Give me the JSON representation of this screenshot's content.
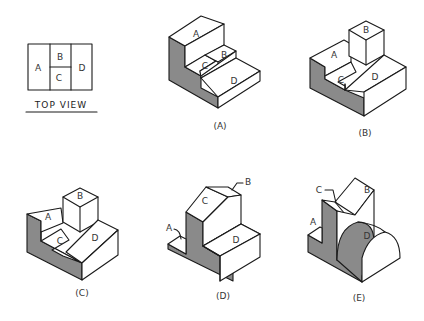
{
  "top_view": {
    "title": "TOP VIEW",
    "regions": {
      "a": "A",
      "b": "B",
      "c": "C",
      "d": "D"
    }
  },
  "figures": [
    {
      "caption": "(A)",
      "labels": {
        "a": "A",
        "b": "B",
        "c": "C",
        "d": "D"
      }
    },
    {
      "caption": "(B)",
      "labels": {
        "a": "A",
        "b": "B",
        "c": "C",
        "d": "D"
      }
    },
    {
      "caption": "(C)",
      "labels": {
        "a": "A",
        "b": "B",
        "c": "C",
        "d": "D"
      }
    },
    {
      "caption": "(D)",
      "labels": {
        "a": "A",
        "b": "B",
        "c": "C",
        "d": "D"
      }
    },
    {
      "caption": "(E)",
      "labels": {
        "a": "A",
        "b": "B",
        "c": "C",
        "d": "D"
      }
    }
  ],
  "colors": {
    "line": "#1a1a1a",
    "shade": "#8a8a8a",
    "background": "#ffffff"
  }
}
